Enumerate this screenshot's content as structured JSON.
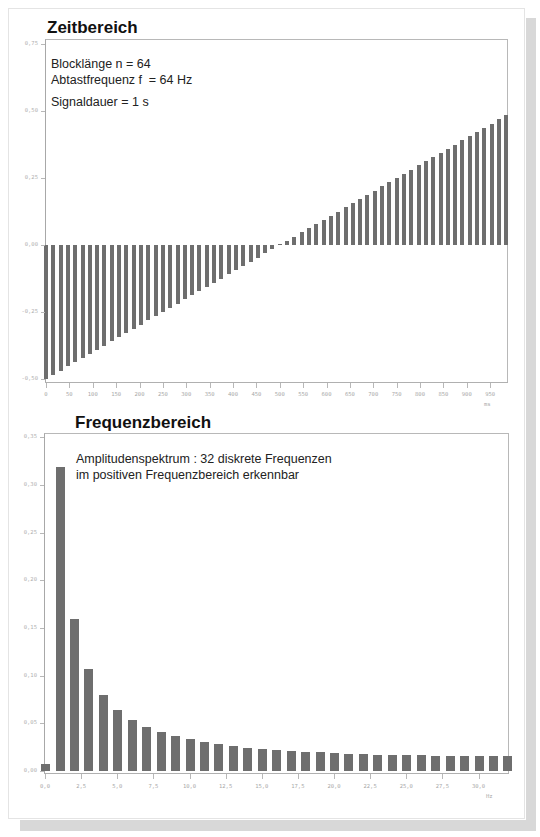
{
  "time_section": {
    "title": "Zeitbereich",
    "info": {
      "line1": "Blocklänge   n = 64",
      "line2_a": "Abtastfrequenz f",
      "line2_sub": "a",
      "line2_b": "  = 64 Hz",
      "line3": "Signaldauer  = 1 s"
    },
    "x_unit": "ms",
    "y_ticks": [
      "0,75",
      "0,50",
      "0,25",
      "0,00",
      "-0,25",
      "-0,50"
    ],
    "x_ticks": [
      "0",
      "50",
      "100",
      "150",
      "200",
      "250",
      "300",
      "350",
      "400",
      "450",
      "500",
      "550",
      "600",
      "650",
      "700",
      "750",
      "800",
      "850",
      "900",
      "950"
    ]
  },
  "freq_section": {
    "title": "Frequenzbereich",
    "info": {
      "line1": "Amplitudenspektrum : 32 diskrete Frequenzen",
      "line2": "im positiven Frequenzbereich erkennbar"
    },
    "x_unit": "Hz",
    "y_ticks": [
      "0,35",
      "0,30",
      "0,25",
      "0,20",
      "0,15",
      "0,10",
      "0,05",
      "0,00"
    ],
    "x_ticks": [
      "0,0",
      "2,5",
      "5,0",
      "7,5",
      "10,0",
      "12,5",
      "15,0",
      "17,5",
      "20,0",
      "22,5",
      "25,0",
      "27,5",
      "30,0"
    ]
  },
  "colors": {
    "bar": "#6e6e6e",
    "axis": "#b0b0b0",
    "tick_label": "#a8a8a8"
  },
  "chart_data": [
    {
      "type": "bar",
      "title": "Zeitbereich",
      "xlabel": "ms",
      "ylabel": "",
      "ylim": [
        -0.5,
        0.75
      ],
      "xlim": [
        0,
        1000
      ],
      "grid": false,
      "annotations": [
        "Blocklänge n = 64",
        "Abtastfrequenz fa = 64 Hz",
        "Signaldauer = 1 s"
      ],
      "x": [
        0,
        15.625,
        31.25,
        46.875,
        62.5,
        78.125,
        93.75,
        109.375,
        125,
        140.625,
        156.25,
        171.875,
        187.5,
        203.125,
        218.75,
        234.375,
        250,
        265.625,
        281.25,
        296.875,
        312.5,
        328.125,
        343.75,
        359.375,
        375,
        390.625,
        406.25,
        421.875,
        437.5,
        453.125,
        468.75,
        484.375,
        500,
        515.625,
        531.25,
        546.875,
        562.5,
        578.125,
        593.75,
        609.375,
        625,
        640.625,
        656.25,
        671.875,
        687.5,
        703.125,
        718.75,
        734.375,
        750,
        765.625,
        781.25,
        796.875,
        812.5,
        828.125,
        843.75,
        859.375,
        875,
        890.625,
        906.25,
        921.875,
        937.5,
        953.125,
        968.75,
        984.375
      ],
      "values": [
        -0.5,
        -0.4844,
        -0.4688,
        -0.4531,
        -0.4375,
        -0.4219,
        -0.4063,
        -0.3906,
        -0.375,
        -0.3594,
        -0.3438,
        -0.3281,
        -0.3125,
        -0.2969,
        -0.2813,
        -0.2656,
        -0.25,
        -0.2344,
        -0.2188,
        -0.2031,
        -0.1875,
        -0.1719,
        -0.1563,
        -0.1406,
        -0.125,
        -0.1094,
        -0.0938,
        -0.0781,
        -0.0625,
        -0.0469,
        -0.0313,
        -0.0156,
        0.0,
        0.0156,
        0.0313,
        0.0469,
        0.0625,
        0.0781,
        0.0938,
        0.1094,
        0.125,
        0.1406,
        0.1563,
        0.1719,
        0.1875,
        0.2031,
        0.2188,
        0.2344,
        0.25,
        0.2656,
        0.2813,
        0.2969,
        0.3125,
        0.3281,
        0.3438,
        0.3594,
        0.375,
        0.3906,
        0.4063,
        0.4219,
        0.4375,
        0.4531,
        0.4688,
        0.4844
      ]
    },
    {
      "type": "bar",
      "title": "Frequenzbereich",
      "xlabel": "Hz",
      "ylabel": "",
      "ylim": [
        0,
        0.35
      ],
      "xlim": [
        0,
        32
      ],
      "grid": false,
      "annotations": [
        "Amplitudenspektrum : 32 diskrete Frequenzen",
        "im positiven Frequenzbereich erkennbar"
      ],
      "x": [
        0,
        1,
        2,
        3,
        4,
        5,
        6,
        7,
        8,
        9,
        10,
        11,
        12,
        13,
        14,
        15,
        16,
        17,
        18,
        19,
        20,
        21,
        22,
        23,
        24,
        25,
        26,
        27,
        28,
        29,
        30,
        31,
        32
      ],
      "values": [
        0.0078,
        0.3184,
        0.1594,
        0.1065,
        0.0801,
        0.0643,
        0.0538,
        0.0464,
        0.0408,
        0.0365,
        0.0331,
        0.0304,
        0.0281,
        0.0262,
        0.0246,
        0.0233,
        0.0221,
        0.0211,
        0.0202,
        0.0195,
        0.0188,
        0.0182,
        0.0177,
        0.0173,
        0.0169,
        0.0166,
        0.0163,
        0.0161,
        0.0159,
        0.0158,
        0.0157,
        0.0156,
        0.0156
      ]
    }
  ]
}
